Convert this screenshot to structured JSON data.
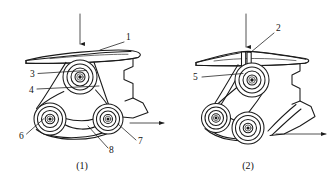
{
  "figure": {
    "panels": [
      {
        "id": "panel-1",
        "caption": "(1)",
        "caption_x": 82,
        "caption_y": 168,
        "input_arrow": {
          "name": "input-force-arrow",
          "direction": "down",
          "x": 80,
          "y_start": 14,
          "y_end": 46
        },
        "output_arrow": {
          "name": "output-motion-arrow",
          "direction": "right",
          "y": 123,
          "x_start": 132,
          "x_end": 166
        },
        "callouts": [
          {
            "number": "1",
            "label_x": 126,
            "label_y": 40,
            "leader": "M 124 42 L 100 50"
          },
          {
            "number": "3",
            "label_x": 32,
            "label_y": 76,
            "leader": "M 38 73 L 86 70"
          },
          {
            "number": "4",
            "label_x": 31,
            "label_y": 92,
            "leader": "M 37 89 L 99 86"
          },
          {
            "number": "6",
            "label_x": 22,
            "label_y": 138,
            "leader": "M 26 134 L 44 118"
          },
          {
            "number": "7",
            "label_x": 138,
            "label_y": 143,
            "leader": "M 136 140 L 118 124"
          },
          {
            "number": "8",
            "label_x": 110,
            "label_y": 152,
            "leader": "M 108 148 L 88 126"
          }
        ],
        "pulleys": [
          {
            "name": "top-pulley",
            "cx": 80,
            "cy": 77,
            "radii": [
              17,
              13,
              9,
              5,
              3.2,
              1.6
            ]
          },
          {
            "name": "left-pulley",
            "cx": 50,
            "cy": 119,
            "radii": [
              16,
              12.5,
              8.5,
              4.8,
              3,
              1.5
            ]
          },
          {
            "name": "right-pulley",
            "cx": 108,
            "cy": 119,
            "radii": [
              15,
              11.5,
              8,
              4.5,
              2.8,
              1.5
            ]
          }
        ]
      },
      {
        "id": "panel-2",
        "caption": "(2)",
        "caption_x": 248,
        "caption_y": 168,
        "input_arrow": {
          "name": "input-force-arrow",
          "direction": "down",
          "x": 246,
          "y_start": 14,
          "y_end": 48
        },
        "output_arrow": {
          "name": "output-motion-arrow",
          "direction": "right",
          "y": 134,
          "x_start": 278,
          "x_end": 328
        },
        "callouts": [
          {
            "number": "2",
            "label_x": 276,
            "label_y": 30,
            "leader": "M 274 33 L 251 52"
          },
          {
            "number": "5",
            "label_x": 196,
            "label_y": 79,
            "leader": "M 202 77 L 243 73"
          }
        ],
        "pulleys": [
          {
            "name": "top-pulley",
            "cx": 252,
            "cy": 80,
            "radii": [
              17,
              13,
              9,
              5,
              3.2,
              1.6
            ]
          },
          {
            "name": "left-pulley",
            "cx": 216,
            "cy": 118,
            "radii": [
              14.5,
              11,
              7.5,
              4.2,
              2.6,
              1.4
            ]
          },
          {
            "name": "lower-pulley",
            "cx": 248,
            "cy": 128,
            "radii": [
              16,
              12.5,
              8.5,
              4.8,
              3,
              1.5
            ]
          }
        ]
      }
    ],
    "colors": {
      "stroke": "#1a1a1a",
      "fill": "#ffffff",
      "background": "#ffffff"
    }
  }
}
